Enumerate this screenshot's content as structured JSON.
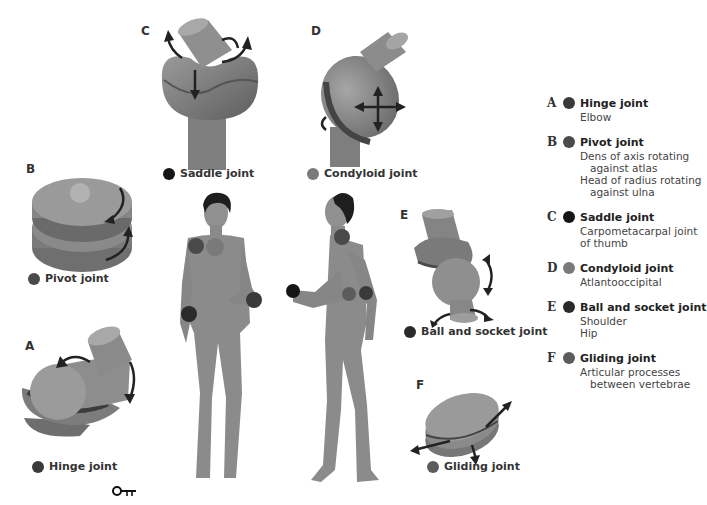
{
  "figure": {
    "type": "anatomical diagram of synovial joint types"
  },
  "colors": {
    "hinge": "#3a3a3a",
    "pivot": "#4a4a4a",
    "saddle": "#151515",
    "condyloid": "#7a7a7a",
    "ball_socket": "#2a2a2a",
    "gliding": "#5c5c5c",
    "body": "#8a8a8a",
    "joint_model": "#7d7d7d"
  },
  "panels": {
    "A": {
      "letter": "A",
      "caption": "Hinge joint"
    },
    "B": {
      "letter": "B",
      "caption": "Pivot joint"
    },
    "C": {
      "letter": "C",
      "caption": "Saddle joint"
    },
    "D": {
      "letter": "D",
      "caption": "Condyloid joint"
    },
    "E": {
      "letter": "E",
      "caption": "Ball and socket joint"
    },
    "F": {
      "letter": "F",
      "caption": "Gliding joint"
    }
  },
  "legend": {
    "items": [
      {
        "letter": "A",
        "title": "Hinge joint",
        "lines": [
          "Elbow"
        ]
      },
      {
        "letter": "B",
        "title": "Pivot joint",
        "lines": [
          "Dens of axis rotating",
          "against atlas",
          "Head of radius rotating",
          "against ulna"
        ]
      },
      {
        "letter": "C",
        "title": "Saddle joint",
        "lines": [
          "Carpometacarpal joint",
          "of thumb"
        ]
      },
      {
        "letter": "D",
        "title": "Condyloid joint",
        "lines": [
          "Atlantooccipital"
        ]
      },
      {
        "letter": "E",
        "title": "Ball and socket joint",
        "lines": [
          "Shoulder",
          "Hip"
        ]
      },
      {
        "letter": "F",
        "title": "Gliding joint",
        "lines": [
          "Articular processes",
          "between vertebrae"
        ]
      }
    ]
  },
  "key_icon": {
    "name": "key-icon",
    "glyph": "O-π"
  }
}
